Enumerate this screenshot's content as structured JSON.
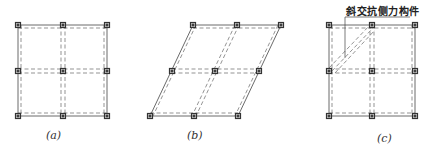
{
  "figure": {
    "panels": [
      {
        "id": "a",
        "caption": "(a)",
        "description": "regular orthogonal 2x2 grid of frames with dashed beams and square column nodes"
      },
      {
        "id": "b",
        "caption": "(b)",
        "description": "skewed (parallelogram) 2x2 grid of frames"
      },
      {
        "id": "c",
        "caption": "(c)",
        "description": "orthogonal 2x2 grid with one diagonal skew lateral-force-resisting member",
        "annotation": "斜交抗侧力构件"
      }
    ],
    "colors": {
      "line": "#444444",
      "dash": "#666666",
      "node": "#333333"
    }
  }
}
